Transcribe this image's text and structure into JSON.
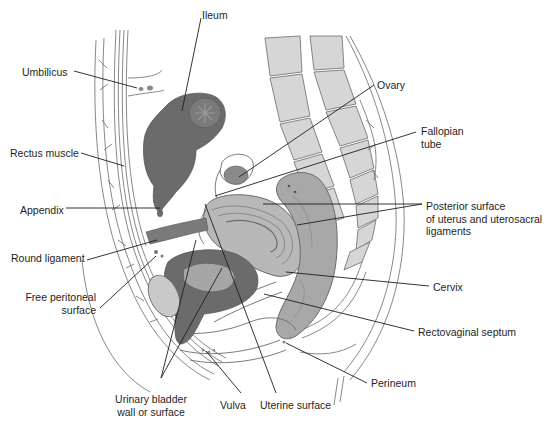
{
  "figure": {
    "colors": {
      "background": "#ffffff",
      "outline": "#5a5a5a",
      "dark_tissue": "#6b6b6b",
      "mid_tissue": "#9a9a9a",
      "light_tissue": "#c9c9c9",
      "bone": "#d6d6d6",
      "leader_line": "#1e1e1e",
      "label_text": "#1e1e1e"
    }
  },
  "labels": [
    {
      "id": "ileum",
      "text": "Ileum",
      "x": 202,
      "y": 9,
      "align": "left"
    },
    {
      "id": "umbilicus",
      "text": "Umbilicus",
      "x": 22,
      "y": 66,
      "align": "left"
    },
    {
      "id": "ovary",
      "text": "Ovary",
      "x": 377,
      "y": 79,
      "align": "left"
    },
    {
      "id": "fallopian-tube",
      "text": "Fallopian\ntube",
      "x": 421,
      "y": 125,
      "align": "left"
    },
    {
      "id": "rectus-muscle",
      "text": "Rectus muscle",
      "x": 10,
      "y": 147,
      "align": "left"
    },
    {
      "id": "appendix",
      "text": "Appendix",
      "x": 20,
      "y": 204,
      "align": "left"
    },
    {
      "id": "posterior-surface",
      "text": "Posterior surface\nof uterus and uterosacral\nligaments",
      "x": 426,
      "y": 200,
      "align": "left"
    },
    {
      "id": "round-ligament",
      "text": "Round ligament",
      "x": 11,
      "y": 252,
      "align": "left"
    },
    {
      "id": "cervix",
      "text": "Cervix",
      "x": 433,
      "y": 281,
      "align": "left"
    },
    {
      "id": "free-peritoneal-surface",
      "text": "Free peritoneal\nsurface",
      "x": 25,
      "y": 291,
      "align": "right",
      "width": 71
    },
    {
      "id": "rectovaginal-septum",
      "text": "Rectovaginal septum",
      "x": 418,
      "y": 326,
      "align": "left"
    },
    {
      "id": "perineum",
      "text": "Perineum",
      "x": 371,
      "y": 377,
      "align": "left"
    },
    {
      "id": "urinary-bladder",
      "text": "Urinary bladder\nwall or surface",
      "x": 109,
      "y": 393,
      "align": "center",
      "width": 84
    },
    {
      "id": "vulva",
      "text": "Vulva",
      "x": 220,
      "y": 399,
      "align": "left"
    },
    {
      "id": "uterine-surface",
      "text": "Uterine surface",
      "x": 260,
      "y": 399,
      "align": "left"
    }
  ],
  "leaders": [
    {
      "for": "ileum",
      "points": [
        [
          201,
          18
        ],
        [
          182,
          111
        ]
      ]
    },
    {
      "for": "umbilicus",
      "points": [
        [
          74,
          71
        ],
        [
          137,
          88
        ]
      ]
    },
    {
      "for": "ovary",
      "points": [
        [
          374,
          85
        ],
        [
          239,
          177
        ]
      ]
    },
    {
      "for": "fallopian-tube",
      "points": [
        [
          416,
          132
        ],
        [
          215,
          196
        ]
      ]
    },
    {
      "for": "rectus-muscle",
      "points": [
        [
          81,
          153
        ],
        [
          124,
          166
        ]
      ]
    },
    {
      "for": "appendix",
      "points": [
        [
          66,
          208
        ],
        [
          160,
          208
        ]
      ]
    },
    {
      "for": "posterior-surface",
      "points": [
        [
          422,
          204
        ],
        [
          263,
          204
        ]
      ]
    },
    {
      "for": "posterior-surface",
      "points": [
        [
          422,
          204
        ],
        [
          297,
          225
        ]
      ]
    },
    {
      "for": "round-ligament",
      "points": [
        [
          87,
          260
        ],
        [
          157,
          240
        ]
      ]
    },
    {
      "for": "free-peritoneal-surface",
      "points": [
        [
          100,
          308
        ],
        [
          156,
          256
        ]
      ]
    },
    {
      "for": "cervix",
      "points": [
        [
          429,
          286
        ],
        [
          286,
          272
        ]
      ]
    },
    {
      "for": "rectovaginal-septum",
      "points": [
        [
          414,
          331
        ],
        [
          264,
          294
        ]
      ]
    },
    {
      "for": "perineum",
      "points": [
        [
          367,
          383
        ],
        [
          286,
          343
        ]
      ]
    },
    {
      "for": "urinary-bladder",
      "points": [
        [
          161,
          378
        ],
        [
          196,
          240
        ]
      ]
    },
    {
      "for": "urinary-bladder",
      "points": [
        [
          161,
          378
        ],
        [
          222,
          268
        ]
      ]
    },
    {
      "for": "vulva",
      "points": [
        [
          241,
          393
        ],
        [
          206,
          351
        ]
      ]
    },
    {
      "for": "uterine-surface",
      "points": [
        [
          276,
          393
        ],
        [
          205,
          204
        ]
      ]
    }
  ]
}
